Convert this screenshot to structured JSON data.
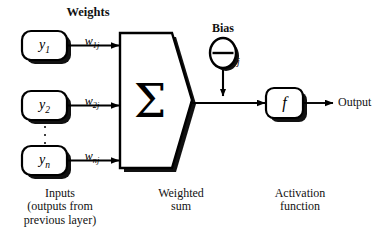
{
  "diagram": {
    "canvas": {
      "width": 379,
      "height": 239
    },
    "ink_color": "#000000",
    "shadow_color": "#1a1a1a",
    "background": "#ffffff"
  },
  "headings": {
    "weights": "Weights",
    "bias": "Bias"
  },
  "inputs": {
    "nodes": [
      {
        "base": "y",
        "subscript": "1"
      },
      {
        "base": "y",
        "subscript": "2"
      },
      {
        "base": "y",
        "subscript": "n"
      }
    ],
    "ellipsis": "⋮",
    "caption_line1": "Inputs",
    "caption_line2": "(outputs from",
    "caption_line3": "previous layer)"
  },
  "weights": {
    "labels": [
      {
        "base": "w",
        "subscript": "1j"
      },
      {
        "base": "w",
        "subscript": "2j"
      },
      {
        "base": "w",
        "subscript": "nj"
      }
    ]
  },
  "summation": {
    "symbol": "Σ",
    "caption_line1": "Weighted",
    "caption_line2": "sum"
  },
  "bias": {
    "symbol": "Θ",
    "subscript": "j",
    "label": "Bias"
  },
  "activation": {
    "symbol": "f",
    "caption_line1": "Activation",
    "caption_line2": "function"
  },
  "output": {
    "label": "Output"
  }
}
